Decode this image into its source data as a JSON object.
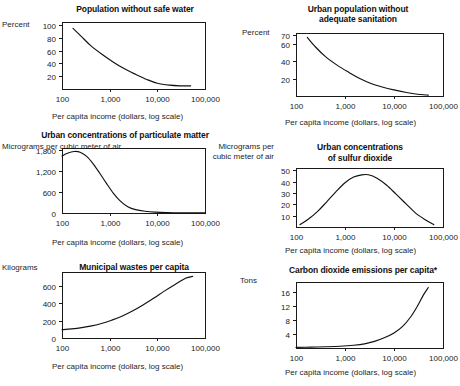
{
  "figure": {
    "panel_count": 6,
    "shared_xlabel": "Per capita income (dollars, log scale)",
    "shared_xticks": [
      "100",
      "1,000",
      "10,000",
      "100,000"
    ],
    "curve_color": "#111111",
    "frame_color": "#1a1a1a",
    "background": "#ffffff"
  },
  "chart_data": [
    {
      "id": "safe-water",
      "type": "line",
      "title": "Population without safe water",
      "ylabel": "Percent",
      "xlabel": "Per capita income (dollars, log scale)",
      "xscale": "log",
      "xlim": [
        100,
        100000
      ],
      "xticks": [
        100,
        1000,
        10000,
        100000
      ],
      "xticklabels": [
        "100",
        "1,000",
        "10,000",
        "100,000"
      ],
      "ylim": [
        0,
        105
      ],
      "yticks": [
        20,
        40,
        60,
        80,
        100
      ],
      "yticklabels": [
        "20",
        "40",
        "60",
        "80",
        "100"
      ],
      "grid": false,
      "legend": "none",
      "x": [
        170,
        250,
        400,
        700,
        1200,
        2000,
        3500,
        6000,
        10000,
        18000,
        30000,
        50000
      ],
      "y": [
        95,
        83,
        68,
        54,
        42,
        32,
        23,
        15,
        9,
        6,
        5,
        5
      ]
    },
    {
      "id": "sanitation",
      "type": "line",
      "title": "Urban population without adequate sanitation",
      "ylabel": "Percent",
      "xlabel": "Per capita income (dollars, log scale)",
      "xscale": "log",
      "xlim": [
        100,
        100000
      ],
      "xticks": [
        100,
        1000,
        10000,
        100000
      ],
      "xticklabels": [
        "100",
        "1,000",
        "10,000",
        "100,000"
      ],
      "ylim": [
        0,
        72
      ],
      "yticks": [
        20,
        40,
        60,
        70
      ],
      "yticklabels": [
        "20",
        "40",
        "60",
        "70"
      ],
      "grid": false,
      "legend": "none",
      "x": [
        170,
        250,
        400,
        700,
        1200,
        2000,
        3500,
        6000,
        10000,
        18000,
        30000,
        50000
      ],
      "y": [
        67,
        56,
        45,
        35,
        27,
        20,
        14,
        10,
        7,
        4,
        2,
        1
      ]
    },
    {
      "id": "particulate-matter",
      "type": "line",
      "title": "Urban concentrations of particulate matter",
      "ylabel": "Micrograms per cubic meter of air",
      "xlabel": "Per capita income (dollars, log scale)",
      "xscale": "log",
      "xlim": [
        100,
        100000
      ],
      "xticks": [
        100,
        1000,
        10000,
        100000
      ],
      "xticklabels": [
        "100",
        "1,000",
        "10,000",
        "100,000"
      ],
      "ylim": [
        0,
        1850
      ],
      "yticks": [
        0,
        600,
        1200,
        1800
      ],
      "yticklabels": [
        "0",
        "600",
        "1,200",
        "1,800"
      ],
      "grid": false,
      "legend": "none",
      "x": [
        100,
        130,
        180,
        240,
        330,
        450,
        620,
        850,
        1200,
        1700,
        2400,
        3500,
        5500,
        9000,
        16000,
        30000,
        100000
      ],
      "y": [
        1620,
        1700,
        1750,
        1730,
        1610,
        1400,
        1130,
        850,
        560,
        330,
        180,
        95,
        50,
        25,
        12,
        5,
        2
      ]
    },
    {
      "id": "sulfur-dioxide",
      "type": "line",
      "title": "Urban concentrations of sulfur dioxide",
      "ylabel": "Micrograms per cubic meter of air",
      "xlabel": "Per capita income (dollars, log scale)",
      "xscale": "log",
      "xlim": [
        100,
        100000
      ],
      "xticks": [
        100,
        1000,
        10000,
        100000
      ],
      "xticklabels": [
        "100",
        "1,000",
        "10,000",
        "100,000"
      ],
      "ylim": [
        0,
        52
      ],
      "yticks": [
        10,
        20,
        30,
        40,
        50
      ],
      "yticklabels": [
        "10",
        "20",
        "30",
        "40",
        "50"
      ],
      "grid": false,
      "legend": "none",
      "x": [
        120,
        180,
        280,
        420,
        650,
        1000,
        1500,
        2200,
        3000,
        4500,
        7000,
        11000,
        18000,
        28000,
        45000,
        65000
      ],
      "y": [
        2,
        7,
        14,
        22,
        31,
        39,
        44,
        46,
        46,
        43,
        37,
        29,
        20,
        12,
        6,
        2
      ]
    },
    {
      "id": "municipal-wastes",
      "type": "line",
      "title": "Municipal wastes per capita",
      "ylabel": "Kilograms",
      "xlabel": "Per capita income (dollars, log scale)",
      "xscale": "log",
      "xlim": [
        100,
        100000
      ],
      "xticks": [
        100,
        1000,
        10000,
        100000
      ],
      "xticklabels": [
        "100",
        "1,000",
        "10,000",
        "100,000"
      ],
      "ylim": [
        0,
        760
      ],
      "yticks": [
        0,
        200,
        400,
        600
      ],
      "yticklabels": [
        "0",
        "200",
        "400",
        "600"
      ],
      "grid": false,
      "legend": "none",
      "x": [
        100,
        160,
        260,
        420,
        700,
        1100,
        1800,
        3000,
        5000,
        8500,
        14000,
        24000,
        40000,
        55000
      ],
      "y": [
        95,
        105,
        120,
        140,
        170,
        205,
        250,
        310,
        380,
        460,
        540,
        620,
        690,
        710
      ]
    },
    {
      "id": "carbon-dioxide",
      "type": "line",
      "title": "Carbon dioxide emissions per capita*",
      "ylabel": "Tons",
      "xlabel": "Per capita income (dollars, log scale)",
      "xscale": "log",
      "xlim": [
        100,
        100000
      ],
      "xticks": [
        100,
        1000,
        10000,
        100000
      ],
      "xticklabels": [
        "100",
        "1,000",
        "10,000",
        "100,000"
      ],
      "ylim": [
        0,
        19
      ],
      "yticks": [
        4,
        8,
        12,
        16
      ],
      "yticklabels": [
        "4",
        "8",
        "12",
        "16"
      ],
      "grid": false,
      "legend": "none",
      "x": [
        100,
        200,
        400,
        800,
        1500,
        2500,
        4000,
        6500,
        10000,
        15000,
        22000,
        30000,
        40000,
        50000
      ],
      "y": [
        0.2,
        0.25,
        0.35,
        0.5,
        0.8,
        1.2,
        1.9,
        3.0,
        4.3,
        6.2,
        9.0,
        12.0,
        15.3,
        17.4
      ]
    }
  ],
  "panels": {
    "safe_water": {
      "title": "Population without safe water",
      "unit": "Percent",
      "xlabel": "Per capita income (dollars, log scale)"
    },
    "sanitation": {
      "title_line1": "Urban population without",
      "title_line2": "adequate sanitation",
      "unit": "Percent",
      "xlabel": "Per capita income (dollars, log scale)"
    },
    "particulate": {
      "title": "Urban concentrations of particulate matter",
      "unit": "Micrograms per cubic meter of air",
      "xlabel": "Per capita income (dollars, log scale)"
    },
    "sulfur": {
      "title_line1": "Urban concentrations",
      "title_line2": "of sulfur dioxide",
      "unit_line1": "Micrograms per",
      "unit_line2": "cubic meter of air",
      "xlabel": "Per capita income (dollars, log scale)"
    },
    "wastes": {
      "title": "Municipal wastes per capita",
      "unit": "Kilograms",
      "xlabel": "Per capita income (dollars, log scale)"
    },
    "carbon": {
      "title": "Carbon dioxide emissions per capita*",
      "unit": "Tons",
      "xlabel": "Per capita income (dollars, log scale)"
    }
  }
}
